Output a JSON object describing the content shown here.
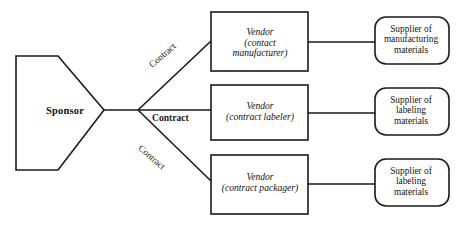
{
  "diagram": {
    "colors": {
      "stroke": "#1a1a1a",
      "fill": "#ffffff",
      "text": "#131313"
    },
    "sponsor": {
      "label": "Sponsor",
      "shape": "pentagon-arrow-right"
    },
    "edges": [
      {
        "label": "Contract",
        "orientation": "rotated-up",
        "from": "sponsor",
        "to": "vendor-contact-manufacturer"
      },
      {
        "label": "Contract",
        "orientation": "horizontal",
        "from": "sponsor",
        "to": "vendor-contract-labeler"
      },
      {
        "label": "Contract",
        "orientation": "rotated-down",
        "from": "sponsor",
        "to": "vendor-contract-packager"
      }
    ],
    "vendors": [
      {
        "line1": "Vendor",
        "line2": "(contact",
        "line3": "manufacturer)",
        "shape": "rectangle"
      },
      {
        "line1": "Vendor",
        "line2": "(contract labeler)",
        "line3": "",
        "shape": "rectangle"
      },
      {
        "line1": "Vendor",
        "line2": "(contract packager)",
        "line3": "",
        "shape": "rectangle"
      }
    ],
    "suppliers": [
      {
        "line1": "Supplier of",
        "line2": "manufacturing",
        "line3": "materials",
        "shape": "rounded-rectangle"
      },
      {
        "line1": "Supplier of",
        "line2": "labeling",
        "line3": "materials",
        "shape": "rounded-rectangle"
      },
      {
        "line1": "Supplier of",
        "line2": "labeling",
        "line3": "materials",
        "shape": "rounded-rectangle"
      }
    ]
  }
}
